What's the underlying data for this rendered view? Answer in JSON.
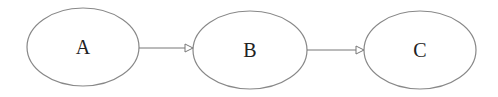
{
  "diagram": {
    "type": "flow",
    "nodes": [
      {
        "id": "A",
        "label": "A"
      },
      {
        "id": "B",
        "label": "B"
      },
      {
        "id": "C",
        "label": "C"
      }
    ],
    "edges": [
      {
        "from": "A",
        "to": "B"
      },
      {
        "from": "B",
        "to": "C"
      }
    ],
    "colors": {
      "stroke": "#777777",
      "text": "#222222",
      "background": "#ffffff"
    }
  }
}
